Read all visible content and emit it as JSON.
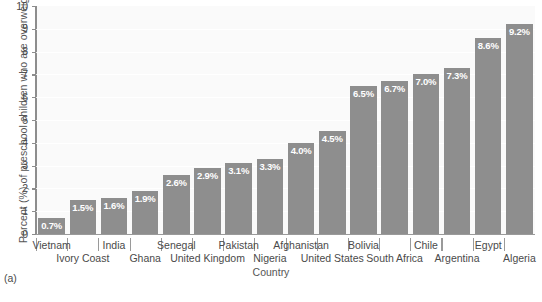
{
  "chart_data": {
    "type": "bar",
    "title": "",
    "xlabel": "Country",
    "ylabel": "Percent (%) of preschool children who are overweight",
    "ylim": [
      0,
      10
    ],
    "yticks": [
      0,
      1,
      2,
      3,
      4,
      5,
      6,
      7,
      8,
      9,
      10
    ],
    "grid": true,
    "legend": "none",
    "bar_color": "#8e8e8e",
    "plot_background": "#fafafa",
    "value_label_color": "#ffffff",
    "categories": [
      "Vietnam",
      "Ivory Coast",
      "India",
      "Ghana",
      "Senegal",
      "United Kingdom",
      "Pakistan",
      "Nigeria",
      "Afghanistan",
      "United States",
      "Bolivia",
      "South Africa",
      "Chile",
      "Argentina",
      "Egypt",
      "Algeria"
    ],
    "values": [
      0.7,
      1.5,
      1.6,
      1.9,
      2.6,
      2.9,
      3.1,
      3.3,
      4.0,
      4.5,
      6.5,
      6.7,
      7.0,
      7.3,
      8.6,
      9.2
    ],
    "value_labels": [
      "0.7%",
      "1.5%",
      "1.6%",
      "1.9%",
      "2.6%",
      "2.9%",
      "3.1%",
      "3.3%",
      "4.0%",
      "4.5%",
      "6.5%",
      "6.7%",
      "7.0%",
      "7.3%",
      "8.6%",
      "9.2%"
    ]
  },
  "figure": {
    "panel_letter": "(a)",
    "cut_off_caption": ""
  }
}
